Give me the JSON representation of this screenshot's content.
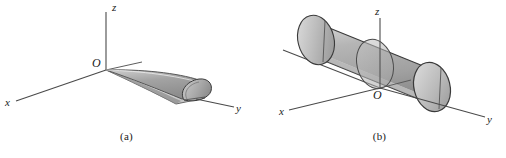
{
  "figure": {
    "panels": [
      {
        "id": "a",
        "caption": "(a)",
        "axes": {
          "x_label": "x",
          "y_label": "y",
          "z_label": "z",
          "origin_label": "O"
        },
        "solid": {
          "name": "half-cylinder-wedge-solid",
          "description": "tapered half-cylinder solid",
          "fill_top": "#9a9a9a",
          "fill_side": "#d8d8d8",
          "fill_cap": "#b4b4b4",
          "outline": "#3a3a3a"
        }
      },
      {
        "id": "b",
        "caption": "(b)",
        "axes": {
          "x_label": "x",
          "y_label": "y",
          "z_label": "z",
          "origin_label": "O"
        },
        "solid": {
          "name": "cylinder-solid",
          "description": "circular cylinder along y-axis",
          "fill_top": "#a8a8a8",
          "fill_side": "#c2c2c2",
          "fill_cap": "#bdbdbd",
          "outline": "#3a3a3a"
        }
      }
    ],
    "colors": {
      "background": "#ffffff",
      "axis_line": "#4a4a4a",
      "text": "#1a1a1a"
    }
  }
}
